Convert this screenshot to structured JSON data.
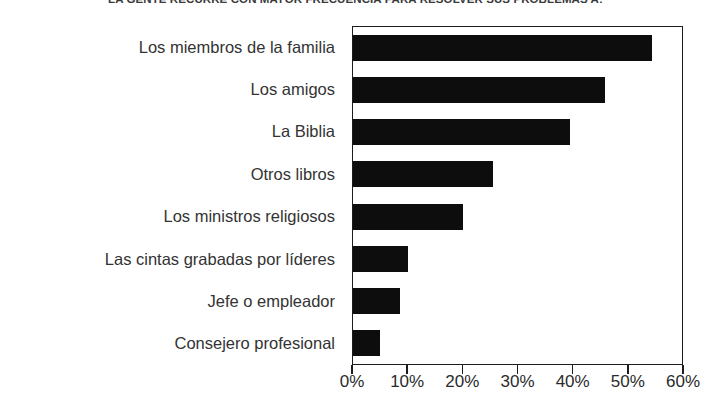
{
  "chart_data": {
    "type": "bar",
    "orientation": "horizontal",
    "title": "LA GENTE RECURRE CON MAYOR FRECUENCIA PARA RESOLVER SUS PROBLEMAS A:",
    "xlabel": "",
    "ylabel": "",
    "categories": [
      "Los miembros de la familia",
      "Los amigos",
      "La Biblia",
      "Otros libros",
      "Los ministros religiosos",
      "Las cintas grabadas por líderes",
      "Jefe o empleador",
      "Consejero profesional"
    ],
    "values": [
      54.5,
      46,
      39.5,
      25.5,
      20,
      10,
      8.5,
      5
    ],
    "value_unit": "%",
    "xlim": [
      0,
      60
    ],
    "xticks": [
      0,
      10,
      20,
      30,
      40,
      50,
      60
    ],
    "xtick_labels": [
      "0%",
      "10%",
      "20%",
      "30%",
      "40%",
      "50%",
      "60%"
    ],
    "grid": false,
    "legend": false,
    "bar_color": "#0d0d0d",
    "frame_color": "#1c1c1c",
    "background": "#ffffff"
  }
}
